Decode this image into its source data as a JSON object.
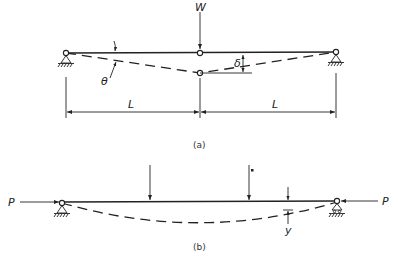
{
  "figure_a": {
    "caption": "(a)",
    "load_label": "W",
    "deflection_label": "δ",
    "angle_label": "θ",
    "span_left_label": "L",
    "span_right_label": "L"
  },
  "figure_b": {
    "caption": "(b)",
    "axial_left_label": "P",
    "axial_right_label": "P",
    "deflection_label": "y"
  }
}
